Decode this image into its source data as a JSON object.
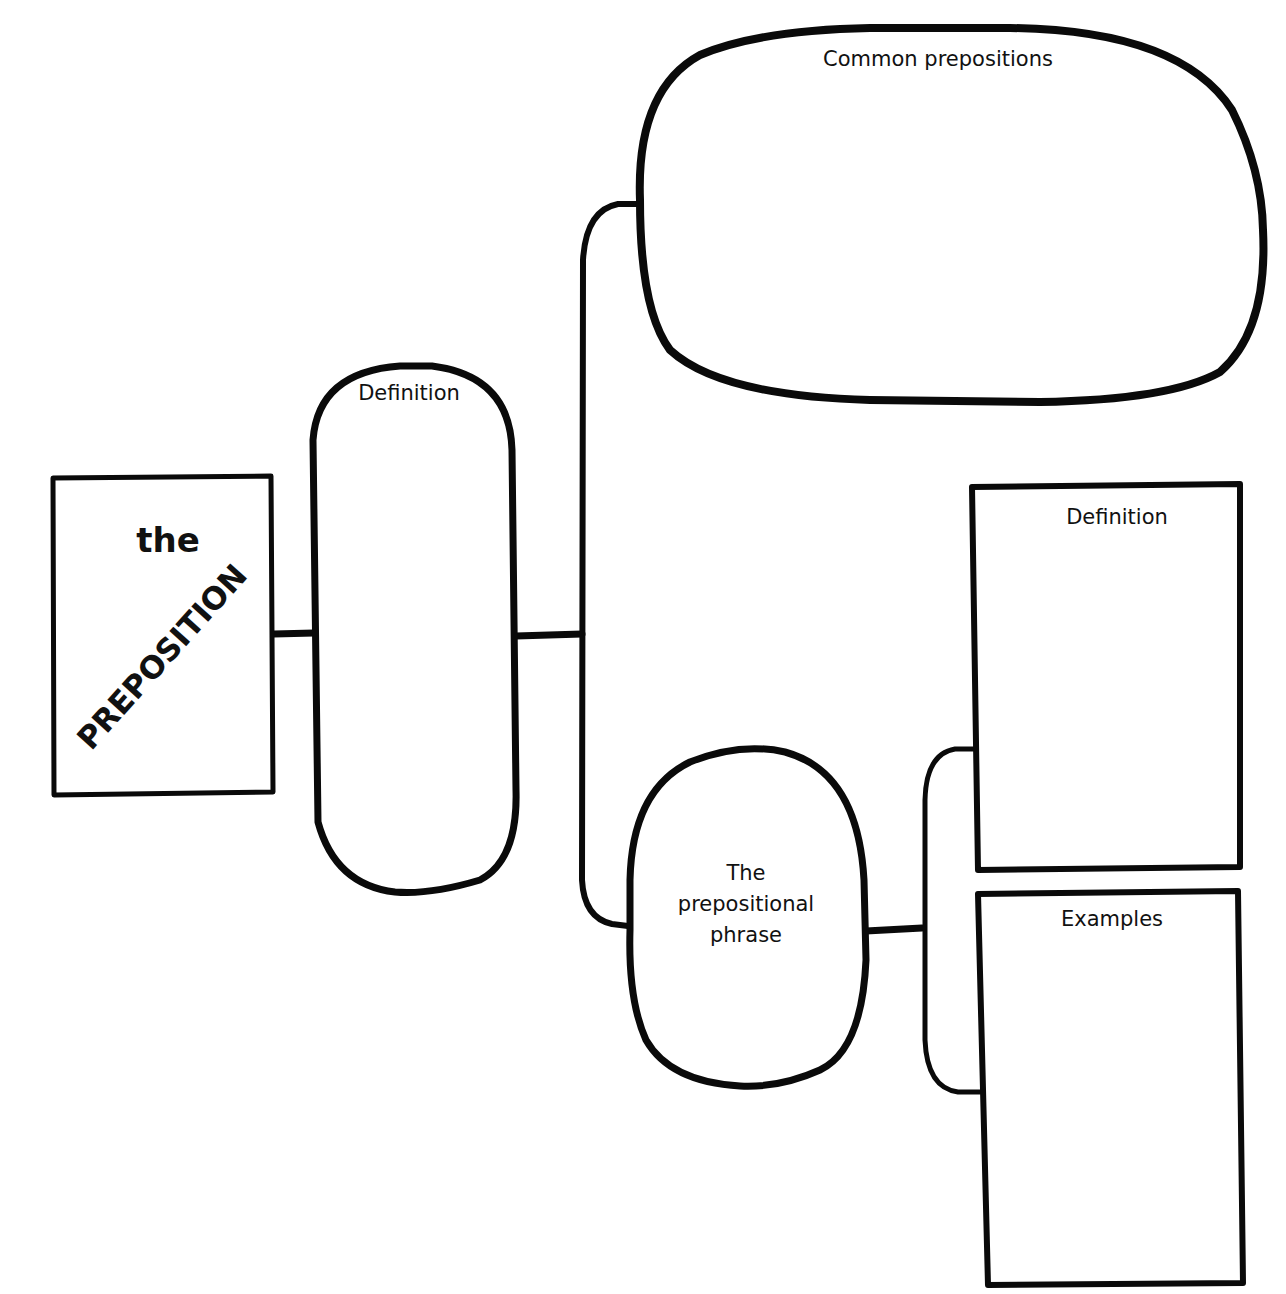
{
  "diagram": {
    "type": "graphic-organizer",
    "stroke_color": "#0a0a0a",
    "background": "#ffffff",
    "nodes": {
      "main": {
        "line1": "the",
        "line2": "PREPOSITION"
      },
      "definition": {
        "title": "Definition"
      },
      "common_prepositions": {
        "title": "Common prepositions"
      },
      "prepositional_phrase": {
        "line1": "The",
        "line2": "prepositional",
        "line3": "phrase"
      },
      "phrase_definition": {
        "title": "Definition"
      },
      "phrase_examples": {
        "title": "Examples"
      }
    },
    "edges": [
      {
        "from": "main",
        "to": "definition"
      },
      {
        "from": "definition",
        "to": "common_prepositions"
      },
      {
        "from": "definition",
        "to": "prepositional_phrase"
      },
      {
        "from": "prepositional_phrase",
        "to": "phrase_definition"
      },
      {
        "from": "prepositional_phrase",
        "to": "phrase_examples"
      }
    ]
  }
}
